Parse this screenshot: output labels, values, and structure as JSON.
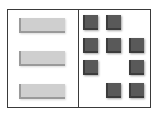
{
  "diagram": {
    "frame_color": "#3a3a3a",
    "left_panel": {
      "bars": [
        {
          "x": 19,
          "y": 18
        },
        {
          "x": 19,
          "y": 51
        },
        {
          "x": 19,
          "y": 84
        }
      ],
      "bar_color": "#cfcfcf"
    },
    "right_panel": {
      "grid_columns": 3,
      "grid_rows": 4,
      "square_color": "#595959",
      "squares": [
        {
          "row": 0,
          "col": 0,
          "x": 83,
          "y": 15
        },
        {
          "row": 0,
          "col": 1,
          "x": 106,
          "y": 15
        },
        {
          "row": 1,
          "col": 0,
          "x": 83,
          "y": 38
        },
        {
          "row": 1,
          "col": 1,
          "x": 106,
          "y": 38
        },
        {
          "row": 1,
          "col": 2,
          "x": 129,
          "y": 38
        },
        {
          "row": 2,
          "col": 0,
          "x": 83,
          "y": 60
        },
        {
          "row": 2,
          "col": 2,
          "x": 129,
          "y": 60
        },
        {
          "row": 3,
          "col": 1,
          "x": 106,
          "y": 83
        },
        {
          "row": 3,
          "col": 2,
          "x": 129,
          "y": 83
        }
      ]
    }
  }
}
